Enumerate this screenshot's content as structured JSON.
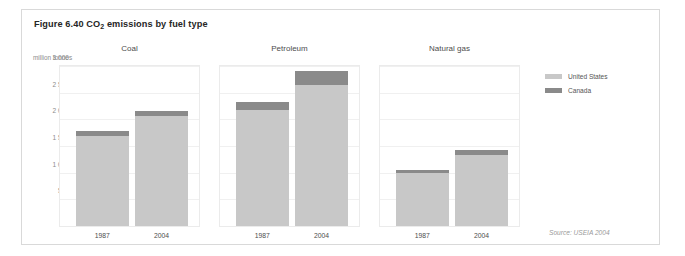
{
  "figure": {
    "title_prefix": "Figure 6.40 CO",
    "title_sub": "2",
    "title_suffix": " emissions by fuel type",
    "units_label": "million tonnes",
    "source": "Source: USEIA 2004"
  },
  "legend": {
    "position": "right",
    "items": [
      {
        "label": "United States",
        "color": "#c8c8c8"
      },
      {
        "label": "Canada",
        "color": "#8a8a8a"
      }
    ]
  },
  "chart_data": {
    "type": "bar",
    "subtype": "stacked-bar-small-multiples",
    "title": "Figure 6.40 CO2 emissions by fuel type",
    "xlabel": "",
    "ylabel": "million tonnes",
    "ylim": [
      0,
      3000
    ],
    "yticks": [
      0,
      500,
      1000,
      1500,
      2000,
      2500,
      3000
    ],
    "ytick_labels": [
      "0",
      "500",
      "1 000",
      "1 500",
      "2 000",
      "2 500",
      "3 000"
    ],
    "grid": true,
    "legend_position": "right",
    "categories": [
      "1987",
      "2004"
    ],
    "series": [
      {
        "name": "United States",
        "color": "#c8c8c8"
      },
      {
        "name": "Canada",
        "color": "#8a8a8a"
      }
    ],
    "panels": [
      {
        "title": "Coal",
        "categories": [
          "1987",
          "2004"
        ],
        "series": [
          {
            "name": "United States",
            "values": [
              1690,
              2060
            ]
          },
          {
            "name": "Canada",
            "values": [
              90,
              90
            ]
          }
        ],
        "totals": [
          1780,
          2150
        ]
      },
      {
        "title": "Petroleum",
        "categories": [
          "1987",
          "2004"
        ],
        "series": [
          {
            "name": "United States",
            "values": [
              2170,
              2640
            ]
          },
          {
            "name": "Canada",
            "values": [
              150,
              260
            ]
          }
        ],
        "totals": [
          2320,
          2900
        ]
      },
      {
        "title": "Natural gas",
        "categories": [
          "1987",
          "2004"
        ],
        "series": [
          {
            "name": "United States",
            "values": [
              990,
              1330
            ]
          },
          {
            "name": "Canada",
            "values": [
              60,
              100
            ]
          }
        ],
        "totals": [
          1050,
          1430
        ]
      }
    ],
    "source": "Source: USEIA 2004"
  }
}
